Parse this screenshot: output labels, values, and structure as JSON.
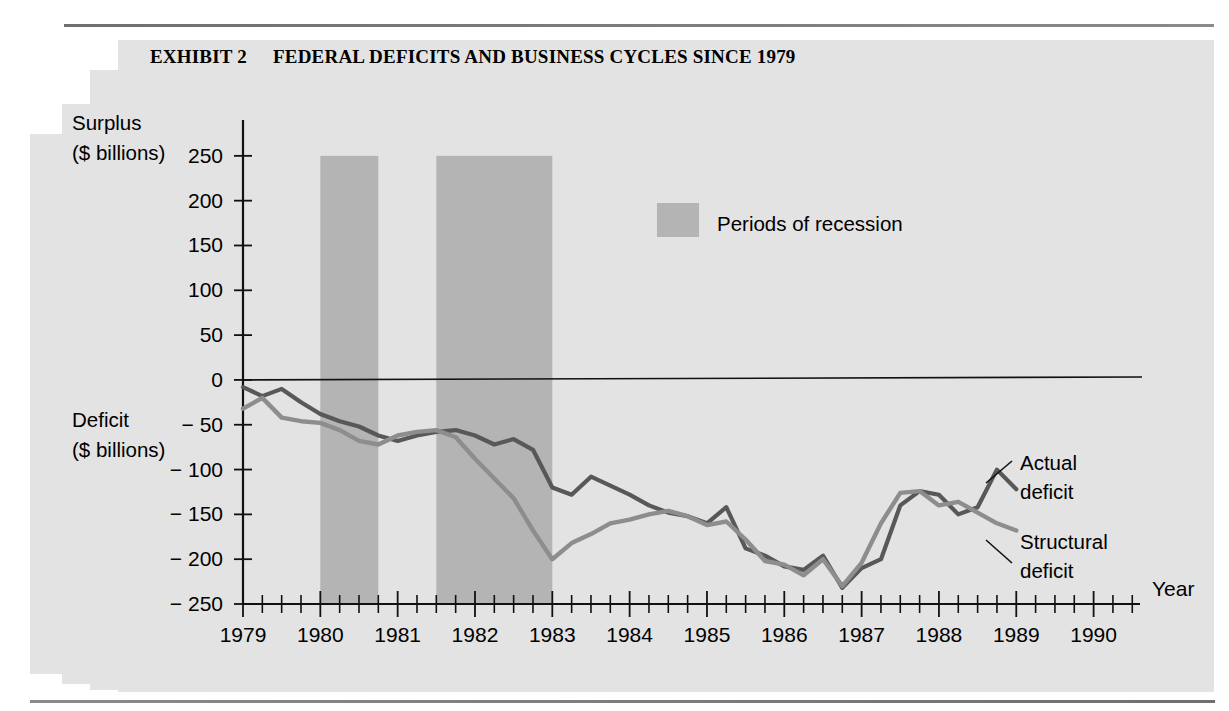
{
  "header": {
    "exhibit_label": "EXHIBIT 2",
    "title": "FEDERAL DEFICITS AND BUSINESS CYCLES SINCE 1979"
  },
  "axis": {
    "y_top_label_line1": "Surplus",
    "y_top_label_line2": "($ billions)",
    "y_bottom_label_line1": "Deficit",
    "y_bottom_label_line2": "($ billions)",
    "x_axis_label": "Year",
    "y_ticks": [
      "250",
      "200",
      "150",
      "100",
      "50",
      "0",
      "− 50",
      "− 100",
      "− 150",
      "− 200",
      "− 250"
    ],
    "x_ticks": [
      "1979",
      "1980",
      "1981",
      "1982",
      "1983",
      "1984",
      "1985",
      "1986",
      "1987",
      "1988",
      "1989",
      "1990"
    ]
  },
  "legend": {
    "recession_label": "Periods of recession",
    "recession_color": "#b4b4b4"
  },
  "annotations": {
    "actual_line1": "Actual",
    "actual_line2": "deficit",
    "structural_line1": "Structural",
    "structural_line2": "deficit"
  },
  "chart_data": {
    "type": "line",
    "title": "FEDERAL DEFICITS AND BUSINESS CYCLES SINCE 1979",
    "xlabel": "Year",
    "ylabel": "Surplus / Deficit ($ billions)",
    "xlim": [
      1979.0,
      1990.6
    ],
    "ylim": [
      -250,
      290
    ],
    "ytick_values": [
      250,
      200,
      150,
      100,
      50,
      0,
      -50,
      -100,
      -150,
      -200,
      -250
    ],
    "xtick_values": [
      1979,
      1980,
      1981,
      1982,
      1983,
      1984,
      1985,
      1986,
      1987,
      1988,
      1989,
      1990
    ],
    "minor_tick_interval": 0.25,
    "grid": false,
    "legend_position": "upper-center",
    "zero_reference_line": 0,
    "shaded_regions": [
      {
        "label": "Periods of recession",
        "x0": 1980.0,
        "x1": 1980.75,
        "color": "#b4b4b4"
      },
      {
        "label": "Periods of recession",
        "x0": 1981.5,
        "x1": 1983.0,
        "color": "#b4b4b4"
      }
    ],
    "series": [
      {
        "name": "Actual deficit",
        "color": "#58585a",
        "x": [
          1979.0,
          1979.25,
          1979.5,
          1979.75,
          1980.0,
          1980.25,
          1980.5,
          1980.75,
          1981.0,
          1981.25,
          1981.5,
          1981.75,
          1982.0,
          1982.25,
          1982.5,
          1982.75,
          1983.0,
          1983.25,
          1983.5,
          1983.75,
          1984.0,
          1984.25,
          1984.5,
          1984.75,
          1985.0,
          1985.25,
          1985.5,
          1985.75,
          1986.0,
          1986.25,
          1986.5,
          1986.75,
          1987.0,
          1987.25,
          1987.5,
          1987.75,
          1988.0,
          1988.25,
          1988.5,
          1988.75,
          1989.0
        ],
        "values": [
          -8,
          -18,
          -10,
          -25,
          -38,
          -46,
          -52,
          -62,
          -68,
          -62,
          -58,
          -56,
          -62,
          -72,
          -66,
          -78,
          -120,
          -128,
          -108,
          -118,
          -128,
          -140,
          -148,
          -152,
          -160,
          -142,
          -188,
          -196,
          -208,
          -212,
          -196,
          -232,
          -210,
          -200,
          -140,
          -124,
          -128,
          -150,
          -142,
          -100,
          -122
        ]
      },
      {
        "name": "Structural deficit",
        "color": "#8d8d8f",
        "x": [
          1979.0,
          1979.25,
          1979.5,
          1979.75,
          1980.0,
          1980.25,
          1980.5,
          1980.75,
          1981.0,
          1981.25,
          1981.5,
          1981.75,
          1982.0,
          1982.25,
          1982.5,
          1982.75,
          1983.0,
          1983.25,
          1983.5,
          1983.75,
          1984.0,
          1984.25,
          1984.5,
          1984.75,
          1985.0,
          1985.25,
          1985.5,
          1985.75,
          1986.0,
          1986.25,
          1986.5,
          1986.75,
          1987.0,
          1987.25,
          1987.5,
          1987.75,
          1988.0,
          1988.25,
          1988.5,
          1988.75,
          1989.0
        ],
        "values": [
          -32,
          -20,
          -42,
          -46,
          -48,
          -56,
          -68,
          -72,
          -62,
          -58,
          -56,
          -64,
          -88,
          -110,
          -132,
          -168,
          -200,
          -182,
          -172,
          -160,
          -156,
          -150,
          -146,
          -152,
          -162,
          -158,
          -178,
          -202,
          -206,
          -218,
          -200,
          -230,
          -204,
          -160,
          -126,
          -124,
          -140,
          -136,
          -148,
          -160,
          -168
        ]
      }
    ]
  }
}
